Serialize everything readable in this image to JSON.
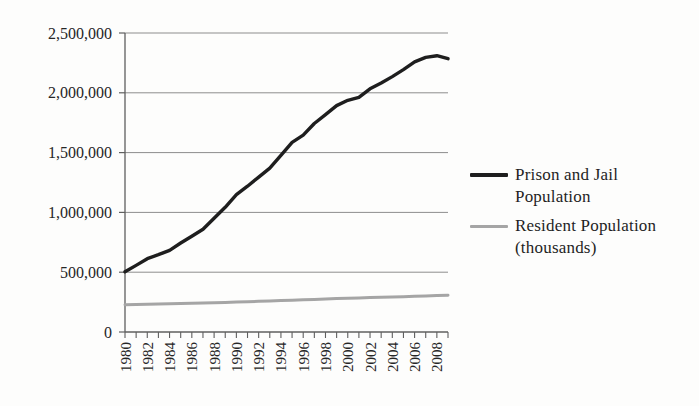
{
  "page": {
    "background_color": "#fdfdfc",
    "text_color": "#1f1f1f"
  },
  "chart_data": {
    "type": "line",
    "title": "",
    "xlabel": "",
    "ylabel": "",
    "grid": "horizontal",
    "legend_position": "right",
    "ylim": [
      0,
      2500000
    ],
    "ytick_interval": 500000,
    "yticks": [
      0,
      500000,
      1000000,
      1500000,
      2000000,
      2500000
    ],
    "ytick_labels": [
      "0",
      "500,000",
      "1,000,000",
      "1,500,000",
      "2,000,000",
      "2,500,000"
    ],
    "x": [
      1980,
      1981,
      1982,
      1983,
      1984,
      1985,
      1986,
      1987,
      1988,
      1989,
      1990,
      1991,
      1992,
      1993,
      1994,
      1995,
      1996,
      1997,
      1998,
      1999,
      2000,
      2001,
      2002,
      2003,
      2004,
      2005,
      2006,
      2007,
      2008,
      2009
    ],
    "xtick_labels": [
      "1980",
      "1982",
      "1984",
      "1986",
      "1988",
      "1990",
      "1992",
      "1994",
      "1996",
      "1998",
      "2000",
      "2002",
      "2004",
      "2006",
      "2008"
    ],
    "xtick_label_rotation_deg": -90,
    "series": [
      {
        "name": "Prison and Jail Population",
        "color": "#1e1e1e",
        "stroke_width": 3.4,
        "values": [
          503600,
          557000,
          612500,
          646400,
          682800,
          744200,
          800600,
          858700,
          951100,
          1043000,
          1148700,
          1219000,
          1295200,
          1369200,
          1476600,
          1585600,
          1646000,
          1743600,
          1816900,
          1893100,
          1937500,
          1961200,
          2033300,
          2081600,
          2135300,
          2193800,
          2258800,
          2296400,
          2310300,
          2284900
        ]
      },
      {
        "name": "Resident Population (thousands)",
        "color": "#a5a5a5",
        "stroke_width": 3,
        "values": [
          227225,
          229466,
          231664,
          233792,
          235825,
          237924,
          240133,
          242289,
          244499,
          246819,
          249623,
          252981,
          256514,
          259919,
          263126,
          266278,
          269394,
          272647,
          275854,
          279040,
          282162,
          284969,
          287625,
          290108,
          292805,
          295517,
          298380,
          301231,
          304094,
          306772
        ]
      }
    ],
    "gridline_color": "#8d8d8d",
    "axis_color": "#5f5f5f",
    "tick_label_color": "#262626"
  },
  "legend": {
    "items": [
      {
        "line1": "Prison and Jail",
        "line2": "Population",
        "color": "#1e1e1e"
      },
      {
        "line1": "Resident Population",
        "line2": "(thousands)",
        "color": "#a5a5a5"
      }
    ]
  }
}
